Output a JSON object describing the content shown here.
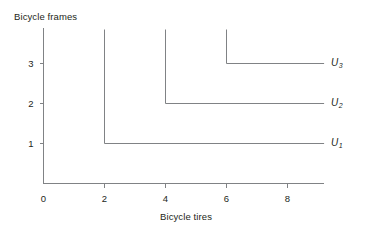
{
  "chart_data": {
    "type": "line",
    "title": "",
    "xlabel": "Bicycle tires",
    "ylabel": "Bicycle frames",
    "xlim": [
      0,
      9.2
    ],
    "ylim": [
      0,
      3.9
    ],
    "xticks": [
      0,
      2,
      4,
      6,
      8
    ],
    "yticks": [
      1,
      2,
      3
    ],
    "xtick_labels": [
      "0",
      "2",
      "4",
      "6",
      "8"
    ],
    "ytick_labels": [
      "1",
      "2",
      "3"
    ],
    "grid": false,
    "legend_position": "right-inline",
    "series": [
      {
        "name": "U1",
        "label": "U",
        "subscript": "1",
        "corner": [
          2,
          1
        ],
        "vertical_top": 3.85,
        "horizontal_end": 9.2,
        "points": [
          [
            2,
            3.85
          ],
          [
            2,
            1
          ],
          [
            9.2,
            1
          ]
        ]
      },
      {
        "name": "U2",
        "label": "U",
        "subscript": "2",
        "corner": [
          4,
          2
        ],
        "vertical_top": 3.85,
        "horizontal_end": 9.2,
        "points": [
          [
            4,
            3.85
          ],
          [
            4,
            2
          ],
          [
            9.2,
            2
          ]
        ]
      },
      {
        "name": "U3",
        "label": "U",
        "subscript": "3",
        "corner": [
          6,
          3
        ],
        "vertical_top": 3.85,
        "horizontal_end": 9.2,
        "points": [
          [
            6,
            3.85
          ],
          [
            6,
            3
          ],
          [
            9.2,
            3
          ]
        ]
      }
    ],
    "colors": {
      "curve": "#808285",
      "axis": "#808285",
      "text": "#231f20",
      "background": "#ffffff"
    }
  }
}
